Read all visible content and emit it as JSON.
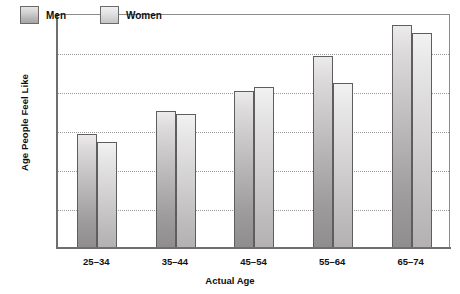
{
  "chart_data": {
    "type": "bar",
    "title": "",
    "xlabel": "Actual Age",
    "ylabel": "Age People Feel Like",
    "categories": [
      "25–34",
      "35–44",
      "45–54",
      "55–64",
      "65–74"
    ],
    "series": [
      {
        "name": "Men",
        "values": [
          29,
          35,
          40,
          49,
          57
        ],
        "color": "#b9b7b7"
      },
      {
        "name": "Women",
        "values": [
          27,
          34,
          41,
          42,
          55
        ],
        "color": "#d2d0d0"
      }
    ],
    "ylim": [
      0,
      60
    ],
    "yticks": [
      0,
      10,
      20,
      30,
      40,
      50,
      60
    ],
    "ytick_labels": [
      "0",
      "10",
      "20",
      "30",
      "40",
      "50",
      "60"
    ],
    "grid": "horizontal-dotted",
    "legend_position": "top-left-inside",
    "border_color": "#888888",
    "gridline_color": "#9a9a9a",
    "background": "#ffffff"
  }
}
